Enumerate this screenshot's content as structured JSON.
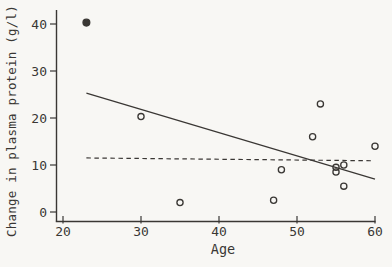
{
  "figure": {
    "background": "#f8f7f4",
    "ink_color": "#3a3734"
  },
  "chart_data": {
    "type": "scatter",
    "title": "",
    "xlabel": "Age",
    "ylabel": "Change in plasma protein (g/l)",
    "xlim": [
      19,
      61
    ],
    "ylim": [
      -2,
      43
    ],
    "x_ticks": [
      20,
      30,
      40,
      50,
      60
    ],
    "y_ticks": [
      0,
      10,
      20,
      30,
      40
    ],
    "grid": false,
    "legend_position": "none",
    "points": [
      {
        "x": 23,
        "y": 40.3,
        "filled": true
      },
      {
        "x": 30,
        "y": 20.3,
        "filled": false
      },
      {
        "x": 35,
        "y": 2.0,
        "filled": false
      },
      {
        "x": 47,
        "y": 2.5,
        "filled": false
      },
      {
        "x": 48,
        "y": 9.0,
        "filled": false
      },
      {
        "x": 52,
        "y": 16.0,
        "filled": false
      },
      {
        "x": 53,
        "y": 23.0,
        "filled": false
      },
      {
        "x": 55,
        "y": 9.5,
        "filled": false
      },
      {
        "x": 55,
        "y": 8.5,
        "filled": false
      },
      {
        "x": 56,
        "y": 10.0,
        "filled": false
      },
      {
        "x": 56,
        "y": 5.5,
        "filled": false
      },
      {
        "x": 60,
        "y": 14.0,
        "filled": false
      }
    ],
    "lines": [
      {
        "name": "regression-line",
        "style": "solid",
        "x1": 23,
        "y1": 25.3,
        "x2": 60,
        "y2": 7.0
      },
      {
        "name": "reference-line",
        "style": "dashed",
        "x1": 23,
        "y1": 11.5,
        "x2": 59.8,
        "y2": 10.9
      }
    ]
  }
}
